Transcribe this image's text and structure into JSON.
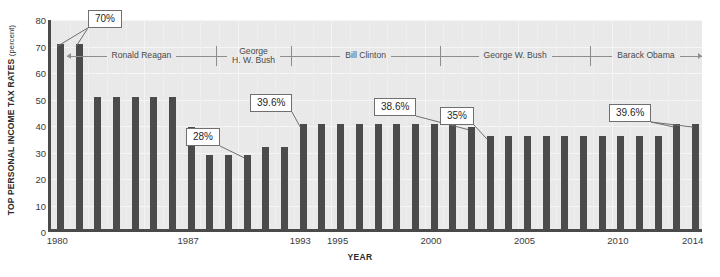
{
  "chart_data": {
    "type": "bar",
    "title": "",
    "xlabel": "YEAR",
    "ylabel": "TOP PERSONAL INCOME TAX RATES",
    "ylabel_unit": "(percent)",
    "ylim": [
      0,
      80
    ],
    "yticks": [
      0,
      10,
      20,
      30,
      40,
      50,
      60,
      70,
      80
    ],
    "grid": true,
    "legend": "none",
    "bar_color": "#4b4b4b",
    "plot_background": "#e9e9e9",
    "categories": [
      1980,
      1981,
      1982,
      1983,
      1984,
      1985,
      1986,
      1987,
      1988,
      1989,
      1990,
      1991,
      1992,
      1993,
      1994,
      1995,
      1996,
      1997,
      1998,
      1999,
      2000,
      2001,
      2002,
      2003,
      2004,
      2005,
      2006,
      2007,
      2008,
      2009,
      2010,
      2011,
      2012,
      2013,
      2014
    ],
    "values": [
      70,
      70,
      50,
      50,
      50,
      50,
      50,
      38.5,
      28,
      28,
      28,
      31,
      31,
      39.6,
      39.6,
      39.6,
      39.6,
      39.6,
      39.6,
      39.6,
      39.6,
      39.1,
      38.6,
      35,
      35,
      35,
      35,
      35,
      35,
      35,
      35,
      35,
      35,
      39.6,
      39.6
    ],
    "xtick_labels": [
      "1980",
      "1987",
      "1993",
      "1995",
      "2000",
      "2005",
      "2010",
      "2014"
    ],
    "xtick_years": [
      1980,
      1987,
      1993,
      1995,
      2000,
      2005,
      2010,
      2014
    ],
    "annotations": [
      {
        "text": "70%",
        "year": 1980,
        "value": 70,
        "targets": [
          1980,
          1981
        ]
      },
      {
        "text": "28%",
        "year": 1990,
        "value": 28,
        "targets": [
          1990
        ]
      },
      {
        "text": "39.6%",
        "year": 1993,
        "value": 39.6,
        "targets": [
          1993
        ]
      },
      {
        "text": "38.6%",
        "year": 2002,
        "value": 38.6,
        "targets": [
          2002
        ]
      },
      {
        "text": "35%",
        "year": 2003,
        "value": 35,
        "targets": [
          2003
        ]
      },
      {
        "text": "39.6%",
        "year": 2013,
        "value": 39.6,
        "targets": [
          2013,
          2014
        ]
      }
    ],
    "eras": [
      {
        "name": "Ronald Reagan",
        "start": 1981,
        "end": 1988,
        "arrow_left": true,
        "arrow_right": false
      },
      {
        "name": "George\nH. W. Bush",
        "start": 1989,
        "end": 1992,
        "arrow_left": false,
        "arrow_right": false
      },
      {
        "name": "Bill Clinton",
        "start": 1993,
        "end": 2000,
        "arrow_left": false,
        "arrow_right": false
      },
      {
        "name": "George W. Bush",
        "start": 2001,
        "end": 2008,
        "arrow_left": false,
        "arrow_right": false
      },
      {
        "name": "Barack Obama",
        "start": 2009,
        "end": 2014,
        "arrow_left": false,
        "arrow_right": true
      }
    ],
    "era_dividers": [
      1988.5,
      1992.5,
      2000.5,
      2008.5
    ]
  }
}
